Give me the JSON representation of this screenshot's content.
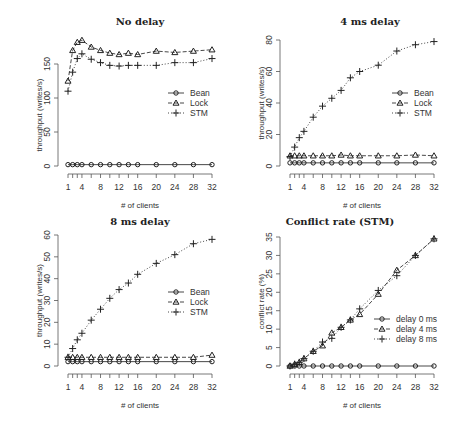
{
  "chart_data": [
    {
      "type": "line",
      "title": "No delay",
      "xlabel": "# of clients",
      "ylabel": "throughput (writes/s)",
      "x": [
        1,
        2,
        3,
        4,
        6,
        8,
        10,
        12,
        14,
        16,
        20,
        24,
        28,
        32
      ],
      "x_tick_labels": [
        "1",
        "4",
        "8",
        "12",
        "16",
        "20",
        "24",
        "28",
        "32"
      ],
      "ylim": [
        0,
        185
      ],
      "y_ticks": [
        0,
        50,
        100,
        150
      ],
      "legend": [
        "Bean",
        "Lock",
        "STM"
      ],
      "legend_position": "right-middle",
      "series": [
        {
          "name": "Bean",
          "marker": "circle",
          "line": "solid",
          "values": [
            2,
            2,
            2,
            2,
            2,
            2,
            2,
            2,
            2,
            2,
            2,
            2,
            2,
            2
          ]
        },
        {
          "name": "Lock",
          "marker": "triangle",
          "line": "dashed",
          "values": [
            125,
            170,
            182,
            185,
            175,
            170,
            166,
            164,
            166,
            164,
            169,
            167,
            169,
            171
          ]
        },
        {
          "name": "STM",
          "marker": "plus",
          "line": "dotted",
          "values": [
            110,
            138,
            158,
            165,
            157,
            152,
            148,
            147,
            148,
            148,
            148,
            152,
            152,
            158
          ]
        }
      ]
    },
    {
      "type": "line",
      "title": "4 ms delay",
      "xlabel": "# of clients",
      "ylabel": "throughput (writes/s)",
      "x": [
        1,
        2,
        3,
        4,
        6,
        8,
        10,
        12,
        14,
        16,
        20,
        24,
        28,
        32
      ],
      "x_tick_labels": [
        "1",
        "4",
        "8",
        "12",
        "16",
        "20",
        "24",
        "28",
        "32"
      ],
      "ylim": [
        0,
        80
      ],
      "y_ticks": [
        0,
        20,
        40,
        60,
        80
      ],
      "legend": [
        "Bean",
        "Lock",
        "STM"
      ],
      "legend_position": "right-middle",
      "series": [
        {
          "name": "Bean",
          "marker": "circle",
          "line": "solid",
          "values": [
            2,
            2,
            2,
            2,
            2,
            2,
            2,
            2,
            2,
            2,
            2,
            2,
            2,
            2
          ]
        },
        {
          "name": "Lock",
          "marker": "triangle",
          "line": "dashed",
          "values": [
            6.5,
            6.5,
            6.5,
            6.5,
            6.5,
            6.5,
            6.5,
            7,
            6.5,
            6.5,
            6.5,
            6.5,
            7,
            6.5
          ]
        },
        {
          "name": "STM",
          "marker": "plus",
          "line": "dotted",
          "values": [
            6,
            12,
            18,
            22,
            31,
            38,
            43,
            48,
            56,
            60,
            64,
            73,
            77,
            79
          ]
        }
      ]
    },
    {
      "type": "line",
      "title": "8 ms delay",
      "xlabel": "# of clients",
      "ylabel": "throughput (writes/s)",
      "x": [
        1,
        2,
        3,
        4,
        6,
        8,
        10,
        12,
        14,
        16,
        20,
        24,
        28,
        32
      ],
      "x_tick_labels": [
        "1",
        "4",
        "8",
        "12",
        "16",
        "20",
        "24",
        "28",
        "32"
      ],
      "ylim": [
        0,
        60
      ],
      "y_ticks": [
        0,
        10,
        20,
        30,
        40,
        50,
        60
      ],
      "legend": [
        "Bean",
        "Lock",
        "STM"
      ],
      "legend_position": "right-middle",
      "series": [
        {
          "name": "Bean",
          "marker": "circle",
          "line": "solid",
          "values": [
            2,
            2,
            2,
            2,
            2,
            2,
            2,
            2,
            2,
            2,
            2,
            2,
            2,
            2
          ]
        },
        {
          "name": "Lock",
          "marker": "triangle",
          "line": "dashed",
          "values": [
            4,
            4,
            4,
            4,
            4,
            4,
            4,
            4,
            4,
            4,
            4,
            4,
            4,
            5
          ]
        },
        {
          "name": "STM",
          "marker": "plus",
          "line": "dotted",
          "values": [
            4,
            8,
            12,
            15,
            21,
            26,
            31,
            35,
            38,
            42,
            47,
            51,
            56,
            58
          ]
        }
      ]
    },
    {
      "type": "line",
      "title": "Conflict rate (STM)",
      "xlabel": "# of clients",
      "ylabel": "conflict rate (%)",
      "x": [
        1,
        2,
        3,
        4,
        6,
        8,
        10,
        12,
        14,
        16,
        20,
        24,
        28,
        32
      ],
      "x_tick_labels": [
        "1",
        "4",
        "8",
        "12",
        "16",
        "20",
        "24",
        "28",
        "32"
      ],
      "ylim": [
        0,
        35
      ],
      "y_ticks": [
        0,
        5,
        10,
        15,
        20,
        25,
        30,
        35
      ],
      "legend": [
        "delay 0 ms",
        "delay 4 ms",
        "delay 8 ms"
      ],
      "legend_position": "right-lower",
      "series": [
        {
          "name": "delay 0 ms",
          "marker": "circle",
          "line": "solid",
          "values": [
            0,
            0,
            0,
            0,
            0,
            0,
            0,
            0,
            0,
            0,
            0,
            0,
            0,
            0
          ]
        },
        {
          "name": "delay 4 ms",
          "marker": "triangle",
          "line": "dashed",
          "values": [
            0,
            0.5,
            1,
            2,
            4,
            5.5,
            9,
            10.5,
            12.5,
            14,
            19.5,
            26,
            30,
            34.5
          ]
        },
        {
          "name": "delay 8 ms",
          "marker": "plus",
          "line": "dotted",
          "values": [
            0,
            0.5,
            1,
            2,
            4,
            6.5,
            7.5,
            10.5,
            12.5,
            15.5,
            20.5,
            24.5,
            30,
            34.5
          ]
        }
      ]
    }
  ],
  "panels": [
    {
      "title": "No delay",
      "xlabel": "# of clients",
      "ylabel": "throughput (writes/s)"
    },
    {
      "title": "4 ms delay",
      "xlabel": "# of clients",
      "ylabel": "throughput (writes/s)"
    },
    {
      "title": "8 ms delay",
      "xlabel": "# of clients",
      "ylabel": "throughput (writes/s)"
    },
    {
      "title": "Conflict rate (STM)",
      "xlabel": "# of clients",
      "ylabel": "conflict rate (%)"
    }
  ],
  "colors": {
    "ink": "#222222",
    "axis": "#555555",
    "background": "#ffffff"
  }
}
